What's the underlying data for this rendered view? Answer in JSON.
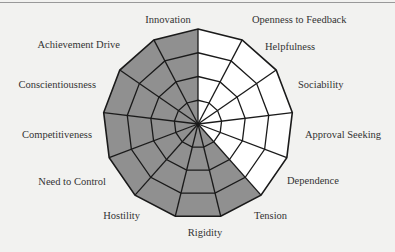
{
  "chart_data": {
    "type": "radar",
    "title": "",
    "center": [
      198,
      124
    ],
    "radius": 95,
    "rings": 4,
    "fill_color": "#909090",
    "empty_color": "#ffffff",
    "line_color": "#1a1a1a",
    "categories": [
      "Openness to Feedback",
      "Helpfulness",
      "Sociability",
      "Approval Seeking",
      "Dependence",
      "Tension",
      "Rigidity",
      "Hostility",
      "Need to Control",
      "Competitiveness",
      "Conscientiousness",
      "Achievement Drive",
      "Innovation"
    ],
    "shaded": [
      false,
      false,
      false,
      false,
      false,
      true,
      true,
      true,
      true,
      true,
      true,
      true,
      true
    ],
    "label_positions": [
      {
        "x": 252,
        "y": 23,
        "anchor": "start"
      },
      {
        "x": 265,
        "y": 50,
        "anchor": "start"
      },
      {
        "x": 298,
        "y": 88,
        "anchor": "start"
      },
      {
        "x": 305,
        "y": 138,
        "anchor": "start"
      },
      {
        "x": 287,
        "y": 184,
        "anchor": "start"
      },
      {
        "x": 254,
        "y": 219,
        "anchor": "start"
      },
      {
        "x": 205,
        "y": 236,
        "anchor": "middle"
      },
      {
        "x": 140,
        "y": 219,
        "anchor": "end"
      },
      {
        "x": 106,
        "y": 185,
        "anchor": "end"
      },
      {
        "x": 92,
        "y": 138,
        "anchor": "end"
      },
      {
        "x": 96,
        "y": 88,
        "anchor": "end"
      },
      {
        "x": 120,
        "y": 48,
        "anchor": "end"
      },
      {
        "x": 168,
        "y": 23,
        "anchor": "middle"
      }
    ]
  }
}
